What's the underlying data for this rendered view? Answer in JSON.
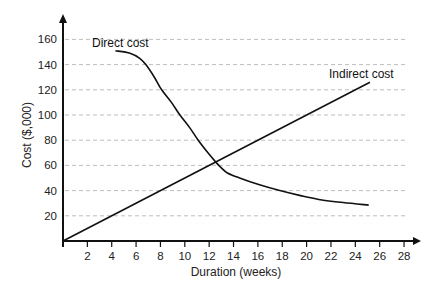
{
  "chart_data": {
    "type": "line",
    "title": "",
    "xlabel": "Duration (weeks)",
    "ylabel": "Cost ($,000)",
    "xlim": [
      0,
      28
    ],
    "ylim": [
      0,
      160
    ],
    "x_ticks": [
      2,
      4,
      6,
      8,
      10,
      12,
      14,
      16,
      18,
      20,
      22,
      24,
      26,
      28
    ],
    "y_ticks": [
      20,
      40,
      60,
      80,
      100,
      120,
      140,
      160
    ],
    "grid": {
      "horizontal": true,
      "vertical": false,
      "style": "dashed"
    },
    "legend": "inline labels",
    "series": [
      {
        "name": "Direct cost",
        "label_position": {
          "x": 4.8,
          "y": 155
        },
        "points": [
          [
            4.3,
            151
          ],
          [
            5.5,
            149
          ],
          [
            6.3,
            145
          ],
          [
            6.8,
            140
          ],
          [
            7.5,
            130
          ],
          [
            8.1,
            120
          ],
          [
            8.9,
            110
          ],
          [
            9.6,
            100
          ],
          [
            10.4,
            90
          ],
          [
            11.1,
            80
          ],
          [
            11.9,
            70
          ],
          [
            12.6,
            62
          ],
          [
            13.0,
            58
          ],
          [
            13.5,
            54
          ],
          [
            14.5,
            50
          ],
          [
            16,
            45
          ],
          [
            17.8,
            40
          ],
          [
            19.5,
            36
          ],
          [
            21,
            33
          ],
          [
            23,
            30.5
          ],
          [
            25.1,
            28.5
          ]
        ]
      },
      {
        "name": "Indirect cost",
        "label_position": {
          "x": 21.8,
          "y": 133
        },
        "points": [
          [
            0,
            0
          ],
          [
            25.2,
            126
          ]
        ]
      }
    ],
    "annotations": [
      {
        "text": "Direct cost",
        "x": 4.8,
        "y": 155
      },
      {
        "text": "Indirect cost",
        "x": 21.8,
        "y": 133
      }
    ],
    "intersection": {
      "x": 13,
      "y": 65
    }
  },
  "colors": {
    "line": "#111111",
    "grid": "#bdbdbd",
    "axis": "#111111"
  }
}
